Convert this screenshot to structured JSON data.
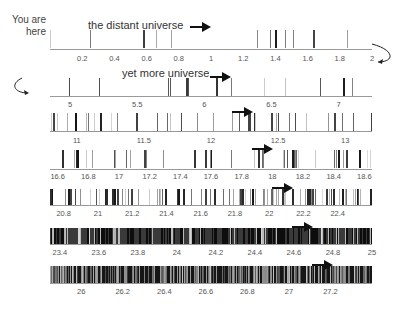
{
  "annotations": {
    "you_are_here": "You are\nhere",
    "you_are_line1": "You are",
    "you_are_line2": "here",
    "row0_title": "the distant universe",
    "row1_title": "yet more universe"
  },
  "chart_data": {
    "type": "barcode_strip",
    "title": "the distant universe",
    "colors": {
      "lines": "#111111",
      "axis": "#999999",
      "arrow": "#111111"
    },
    "rows": [
      {
        "range": [
          0,
          2
        ],
        "ticks": [
          "0.2",
          "0.4",
          "0.6",
          "0.8",
          "1",
          "1.2",
          "1.4",
          "1.6",
          "1.8",
          "2"
        ],
        "tick_values": [
          0.2,
          0.4,
          0.6,
          0.8,
          1,
          1.2,
          1.4,
          1.6,
          1.8,
          2
        ],
        "density": "sparse",
        "annotation": "the distant universe"
      },
      {
        "range": [
          4.85,
          7.25
        ],
        "ticks": [
          "5",
          "5.5",
          "6",
          "6.5",
          "7"
        ],
        "tick_values": [
          5,
          5.5,
          6,
          6.5,
          7
        ],
        "density": "sparse",
        "annotation": "yet more universe"
      },
      {
        "range": [
          10.8,
          13.2
        ],
        "ticks": [
          "11",
          "11.5",
          "12",
          "12.5",
          "13"
        ],
        "tick_values": [
          11,
          11.5,
          12,
          12.5,
          13
        ],
        "density": "moderate"
      },
      {
        "range": [
          16.55,
          18.65
        ],
        "ticks": [
          "16.6",
          "16.8",
          "17",
          "17.2",
          "17.4",
          "17.6",
          "17.8",
          "18",
          "18.2",
          "18.4",
          "18.6"
        ],
        "tick_values": [
          16.6,
          16.8,
          17,
          17.2,
          17.4,
          17.6,
          17.8,
          18,
          18.2,
          18.4,
          18.6
        ],
        "density": "moderate"
      },
      {
        "range": [
          20.72,
          22.6
        ],
        "ticks": [
          "20.8",
          "21",
          "21.2",
          "21.4",
          "21.6",
          "21.8",
          "22",
          "22.2",
          "22.4"
        ],
        "tick_values": [
          20.8,
          21,
          21.2,
          21.4,
          21.6,
          21.8,
          22,
          22.2,
          22.4
        ],
        "density": "dense"
      },
      {
        "range": [
          23.35,
          25.0
        ],
        "ticks": [
          "23.4",
          "23.6",
          "23.8",
          "24",
          "24.2",
          "24.4",
          "24.6",
          "24.8",
          "25"
        ],
        "tick_values": [
          23.4,
          23.6,
          23.8,
          24,
          24.2,
          24.4,
          24.6,
          24.8,
          25
        ],
        "density": "very dense"
      },
      {
        "range": [
          25.85,
          27.4
        ],
        "ticks": [
          "26",
          "26.2",
          "26.4",
          "26.6",
          "26.8",
          "27",
          "27.2"
        ],
        "tick_values": [
          26,
          26.2,
          26.4,
          26.6,
          26.8,
          27,
          27.2
        ],
        "density": "saturated"
      }
    ],
    "xlabel": "",
    "ylabel": "",
    "grid": false,
    "legend": null
  },
  "layout": {
    "rows": [
      {
        "x0": 50,
        "x1": 372,
        "top": 30,
        "bottom": 48,
        "axis_y": 49,
        "tick_y": 54,
        "arrow": [
          190,
          22
        ]
      },
      {
        "x0": 50,
        "x1": 372,
        "top": 78,
        "bottom": 96,
        "axis_y": 96,
        "tick_y": 100,
        "arrow": [
          210,
          72
        ]
      },
      {
        "x0": 50,
        "x1": 372,
        "top": 113,
        "bottom": 131,
        "axis_y": 131,
        "tick_y": 136,
        "arrow": [
          232,
          107
        ]
      },
      {
        "x0": 50,
        "x1": 372,
        "top": 150,
        "bottom": 168,
        "axis_y": 169,
        "tick_y": 172,
        "arrow": [
          252,
          144
        ]
      },
      {
        "x0": 50,
        "x1": 372,
        "top": 189,
        "bottom": 205,
        "axis_y": 205,
        "tick_y": 209,
        "arrow": [
          272,
          183
        ]
      },
      {
        "x0": 50,
        "x1": 372,
        "top": 228,
        "bottom": 244,
        "axis_y": 244,
        "tick_y": 248,
        "arrow": [
          292,
          222
        ]
      },
      {
        "x0": 50,
        "x1": 372,
        "top": 266,
        "bottom": 283,
        "axis_y": 283,
        "tick_y": 287,
        "arrow": [
          312,
          260
        ]
      }
    ]
  }
}
